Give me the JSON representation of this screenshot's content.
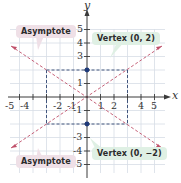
{
  "diagram": {
    "type": "hyperbola-graph",
    "axes": {
      "x_label": "x",
      "y_label": "y",
      "x_range": [
        -5,
        5
      ],
      "y_range": [
        -5,
        5
      ],
      "x_ticks": [
        "-5",
        "-4",
        "-2",
        "-1",
        "1",
        "2",
        "4",
        "5"
      ],
      "y_ticks": [
        "5",
        "4",
        "3",
        "1",
        "-1",
        "-3",
        "-4",
        "-5"
      ]
    },
    "callouts": {
      "asymptote_top": "Asymptote",
      "asymptote_bottom": "Asymptote",
      "vertex_top": "Vertex (0, 2)",
      "vertex_bottom": "Vertex (0, −2)"
    },
    "vertices": [
      [
        0,
        2
      ],
      [
        0,
        -2
      ]
    ],
    "central_rectangle": {
      "x": [
        -3,
        3
      ],
      "y": [
        -2,
        2
      ]
    },
    "asymptotes": [
      "y = (2/3)x",
      "y = -(2/3)x"
    ],
    "colors": {
      "grid": "#d7dde6",
      "axis": "#3a3a3a",
      "asymptote": "#c0506a",
      "rectangle": "#2f4470",
      "vertex_point": "#1e3a7a",
      "callout_pink": "#efe0e7",
      "callout_green": "#dff0e4"
    }
  }
}
